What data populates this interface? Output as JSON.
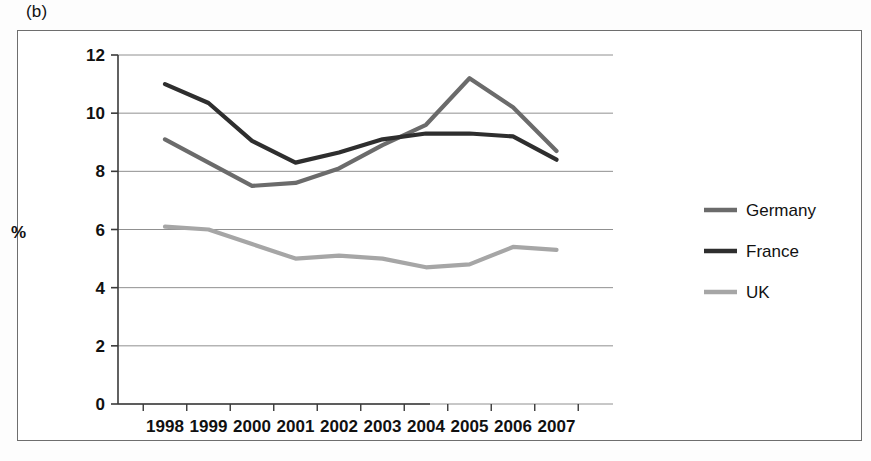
{
  "figure": {
    "panel_label": "(b)",
    "y_axis_title": "%"
  },
  "chart_data": {
    "type": "line",
    "title": "",
    "xlabel": "",
    "ylabel": "%",
    "categories": [
      "1998",
      "1999",
      "2000",
      "2001",
      "2002",
      "2003",
      "2004",
      "2005",
      "2006",
      "2007"
    ],
    "series": [
      {
        "name": "Germany",
        "color": "#6b6b6b",
        "values": [
          9.1,
          8.3,
          7.5,
          7.6,
          8.1,
          8.9,
          9.6,
          11.2,
          10.2,
          8.7
        ]
      },
      {
        "name": "France",
        "color": "#2e2e2e",
        "values": [
          11.0,
          10.35,
          9.05,
          8.3,
          8.65,
          9.1,
          9.3,
          9.3,
          9.2,
          8.4
        ]
      },
      {
        "name": "UK",
        "color": "#a6a6a6",
        "values": [
          6.1,
          6.0,
          5.5,
          5.0,
          5.1,
          5.0,
          4.7,
          4.8,
          5.4,
          5.3
        ]
      }
    ],
    "ylim": [
      0,
      12
    ],
    "yticks": [
      0,
      2,
      4,
      6,
      8,
      10,
      12
    ],
    "ytick_labels": [
      "0",
      "2",
      "4",
      "6",
      "8",
      "10",
      "12"
    ],
    "grid": true,
    "grid_color": "#909090",
    "legend_position": "right",
    "legend": [
      "Germany",
      "France",
      "UK"
    ]
  }
}
